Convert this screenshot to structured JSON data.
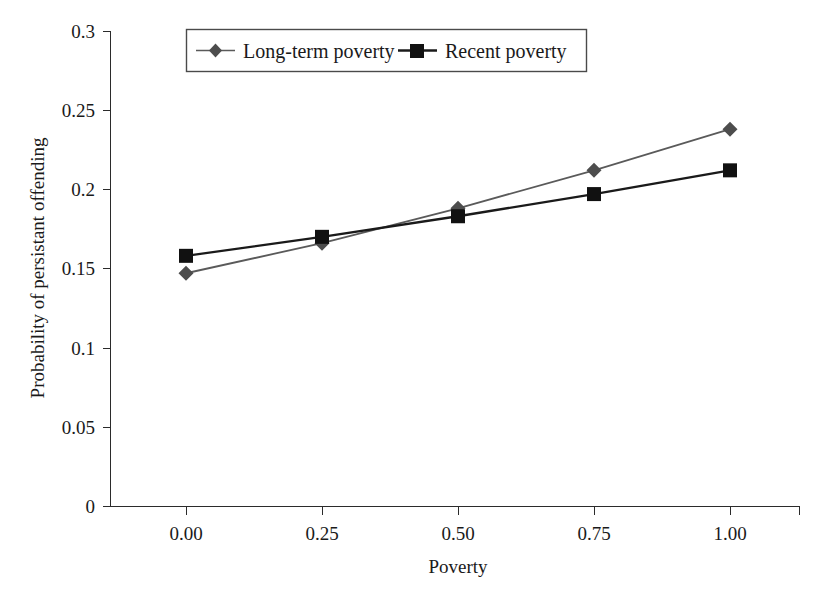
{
  "chart_data": {
    "type": "line",
    "title": "",
    "xlabel": "Poverty",
    "ylabel": "Probability of persistant offending",
    "x": [
      0.0,
      0.25,
      0.5,
      0.75,
      1.0
    ],
    "xtick_labels": [
      "0.00",
      "0.25",
      "0.50",
      "0.75",
      "1.00"
    ],
    "ytick_labels": [
      "0",
      "0.05",
      "0.1",
      "0.15",
      "0.2",
      "0.25",
      "0.3"
    ],
    "yticks": [
      0,
      0.05,
      0.1,
      0.15,
      0.2,
      0.25,
      0.3
    ],
    "xlim": [
      -0.125,
      1.125
    ],
    "ylim": [
      0,
      0.3
    ],
    "grid": false,
    "legend_position": "top-center",
    "series": [
      {
        "name": "Long-term poverty",
        "marker": "diamond",
        "color": "#5a5a5a",
        "values": [
          0.147,
          0.166,
          0.188,
          0.212,
          0.238
        ]
      },
      {
        "name": "Recent poverty",
        "marker": "square",
        "color": "#1a1a1a",
        "values": [
          0.158,
          0.17,
          0.183,
          0.197,
          0.212
        ]
      }
    ]
  },
  "legend": {
    "entries": [
      {
        "label": "Long-term poverty",
        "marker_icon": "diamond-marker-icon"
      },
      {
        "label": "Recent poverty",
        "marker_icon": "square-marker-icon"
      }
    ]
  },
  "axes": {
    "x_title": "Poverty",
    "y_title": "Probability of persistant offending",
    "x_ticks": [
      "0.00",
      "0.25",
      "0.50",
      "0.75",
      "1.00"
    ],
    "y_ticks": [
      "0.3",
      "0.25",
      "0.2",
      "0.15",
      "0.1",
      "0.05",
      "0"
    ]
  }
}
